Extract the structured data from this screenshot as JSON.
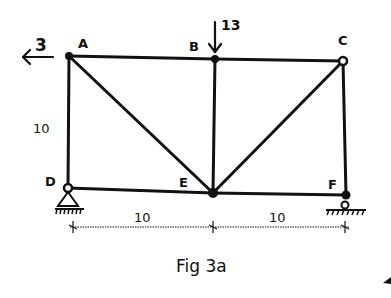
{
  "figure": {
    "caption": "Fig 3a",
    "type": "truss",
    "nodes": [
      {
        "id": "A",
        "label": "A",
        "x": 69,
        "y": 56
      },
      {
        "id": "B",
        "label": "B",
        "x": 215,
        "y": 59
      },
      {
        "id": "C",
        "label": "C",
        "x": 343,
        "y": 61
      },
      {
        "id": "D",
        "label": "D",
        "x": 68,
        "y": 188
      },
      {
        "id": "E",
        "label": "E",
        "x": 213,
        "y": 193
      },
      {
        "id": "F",
        "label": "F",
        "x": 346,
        "y": 195
      }
    ],
    "members": [
      [
        "A",
        "B"
      ],
      [
        "B",
        "C"
      ],
      [
        "A",
        "D"
      ],
      [
        "A",
        "E"
      ],
      [
        "B",
        "E"
      ],
      [
        "C",
        "E"
      ],
      [
        "C",
        "F"
      ],
      [
        "D",
        "E"
      ],
      [
        "E",
        "F"
      ]
    ],
    "loads": [
      {
        "node": "A",
        "direction": "left",
        "value": "3"
      },
      {
        "node": "B",
        "direction": "down",
        "value": "13"
      }
    ],
    "supports": [
      {
        "node": "D",
        "type": "pin"
      },
      {
        "node": "F",
        "type": "roller"
      }
    ],
    "dimensions": {
      "height": "10",
      "spans": [
        "10",
        "10"
      ]
    }
  }
}
